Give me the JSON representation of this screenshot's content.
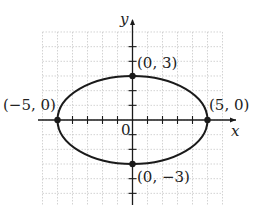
{
  "chart_data": {
    "type": "line",
    "title": "",
    "curve": "ellipse x^2/25 + y^2/9 = 1",
    "xlabel": "x",
    "ylabel": "y",
    "xlim": [
      -6,
      6
    ],
    "ylim": [
      -6,
      6
    ],
    "grid": true,
    "origin_label": "0",
    "series": [
      {
        "name": "ellipse",
        "a": 5,
        "b": 3,
        "center": [
          0,
          0
        ]
      }
    ],
    "points": [
      {
        "x": 0,
        "y": 3,
        "label": "(0, 3)"
      },
      {
        "x": 5,
        "y": 0,
        "label": "(5, 0)"
      },
      {
        "x": -5,
        "y": 0,
        "label": "(−5, 0)"
      },
      {
        "x": 0,
        "y": -3,
        "label": "(0, −3)"
      }
    ],
    "colors": {
      "curve": "#1a1a1a",
      "grid": "#c8c8c8",
      "axis": "#1a1a1a"
    }
  },
  "labels": {
    "x_axis": "x",
    "y_axis": "y",
    "origin": "0",
    "p_top": "(0, 3)",
    "p_right": "(5, 0)",
    "p_left": "(−5, 0)",
    "p_bottom": "(0, −3)"
  }
}
